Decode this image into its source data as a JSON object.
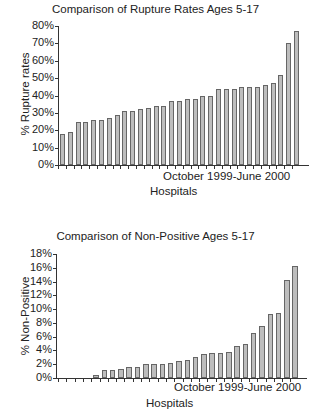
{
  "chart_data": [
    {
      "type": "bar",
      "title": "Comparison of Rupture Rates Ages 5-17",
      "xlabel": "Hospitals",
      "x_annotation": "October 1999-June 2000",
      "ylabel": "% Rupture rates",
      "ylim": [
        0,
        80
      ],
      "yticks": [
        "0%",
        "10%",
        "20%",
        "30%",
        "40%",
        "50%",
        "60%",
        "70%",
        "80%"
      ],
      "grid": false,
      "legend": null,
      "values": [
        18,
        19,
        25,
        25,
        26,
        26,
        27,
        29,
        31,
        31,
        32,
        33,
        34,
        34,
        37,
        37,
        38,
        38,
        40,
        40,
        44,
        44,
        44,
        45,
        45,
        45,
        46,
        47,
        52,
        70,
        77
      ]
    },
    {
      "type": "bar",
      "title": "Comparison of Non-Positive Ages 5-17",
      "xlabel": "Hospitals",
      "x_annotation": "October 1999-June 2000",
      "ylabel": "% Non-Positive",
      "ylim": [
        0,
        18
      ],
      "yticks": [
        "0%",
        "2%",
        "4%",
        "6%",
        "8%",
        "10%",
        "12%",
        "14%",
        "16%",
        "18%"
      ],
      "grid": false,
      "legend": null,
      "values": [
        0,
        0,
        0,
        0,
        0.5,
        1.1,
        1.2,
        1.3,
        1.6,
        1.6,
        2.0,
        2.0,
        2.1,
        2.2,
        2.4,
        2.6,
        3.1,
        3.5,
        3.6,
        3.6,
        3.8,
        4.6,
        4.9,
        6.6,
        7.5,
        9.3,
        9.4,
        14.2,
        16.2
      ]
    }
  ],
  "colors": {
    "bar_fill": "#bdbdbd",
    "bar_edge": "#666666",
    "axis": "#333333"
  }
}
